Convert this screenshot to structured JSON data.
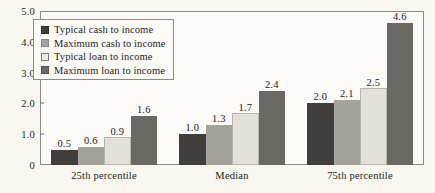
{
  "chart_data": {
    "type": "bar",
    "title": "",
    "subtitle": "",
    "xlabel": "",
    "ylabel": "",
    "categories": [
      "25th percentile",
      "Median",
      "75th percentile"
    ],
    "series": [
      {
        "name": "Typical cash to income",
        "values": [
          0.5,
          1.0,
          2.0
        ],
        "color": "#403d3a"
      },
      {
        "name": "Maximum cash to income",
        "values": [
          0.6,
          1.3,
          2.1
        ],
        "color": "#a5a29c"
      },
      {
        "name": "Typical loan to income",
        "values": [
          0.9,
          1.7,
          2.5
        ],
        "color": "#e2e0d8"
      },
      {
        "name": "Maximum loan to income",
        "values": [
          1.6,
          2.4,
          4.6
        ],
        "color": "#6c6964"
      }
    ],
    "data_labels": [
      [
        "0.5",
        "0.6",
        "0.9",
        "1.6"
      ],
      [
        "1.0",
        "1.3",
        "1.7",
        "2.4"
      ],
      [
        "2.0",
        "2.1",
        "2.5",
        "4.6"
      ]
    ],
    "ylim": [
      0,
      5.0
    ],
    "yticks": [
      0,
      1.0,
      2.0,
      3.0,
      4.0,
      5.0
    ],
    "ytick_labels": [
      "0",
      "1.0",
      "2.0",
      "3.0",
      "4.0",
      "5.0"
    ],
    "grid": false,
    "legend_position": "upper-left",
    "legend_entries": [
      "Typical cash to income",
      "Maximum cash to income",
      "Typical loan to income",
      "Maximum loan to income"
    ]
  }
}
